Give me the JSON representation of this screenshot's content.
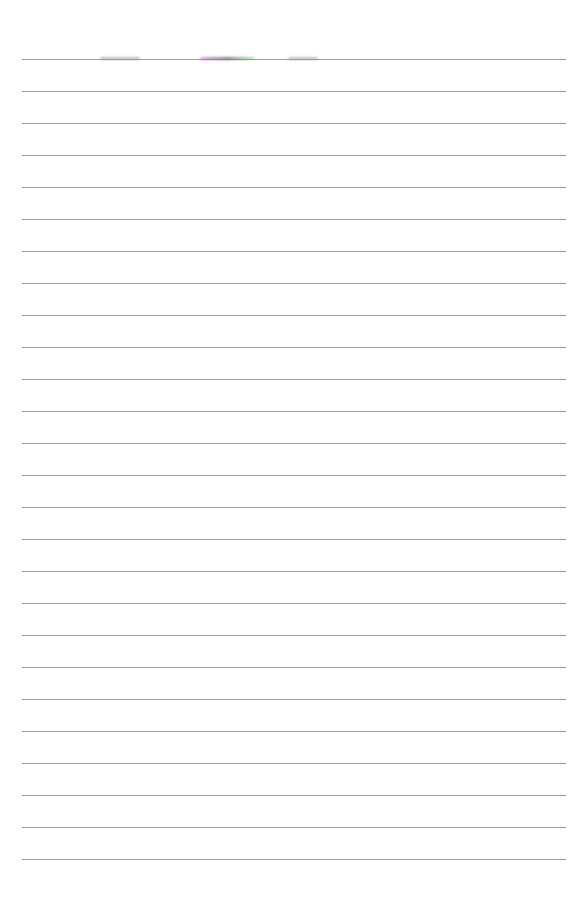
{
  "page": {
    "type": "lined-paper",
    "background": "#ffffff",
    "rule_color": "#8a8a8a",
    "rule_count": 26,
    "first_rule_y": 59,
    "rule_spacing": 32,
    "rule_left": 22,
    "rule_width": 544
  },
  "artifacts": [
    {
      "name": "gray-smudge-left",
      "x": 100,
      "y": 57,
      "w": 40,
      "color": "#9a9a9a"
    },
    {
      "name": "color-smudge-center",
      "x": 200,
      "y": 57,
      "w": 55,
      "color": "#b070b0"
    },
    {
      "name": "gray-smudge-right",
      "x": 288,
      "y": 57,
      "w": 30,
      "color": "#9a9a9a"
    }
  ]
}
